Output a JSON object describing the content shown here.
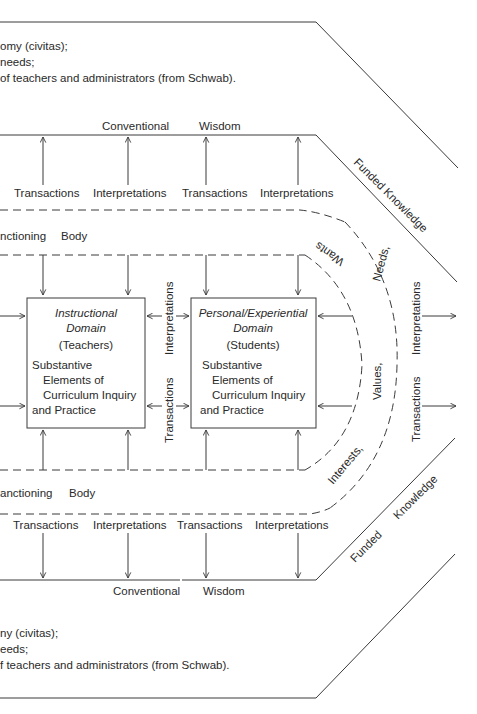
{
  "top_notes": [
    "omy (civitas);",
    "needs;",
    "of teachers and administrators (from Schwab)."
  ],
  "bottom_notes": [
    "ny (civitas);",
    "eeds;",
    "f teachers and administrators (from Schwab)."
  ],
  "top_band": {
    "conventional": "Conventional",
    "wisdom": "Wisdom",
    "labels": [
      "Transactions",
      "Interpretations",
      "Transactions",
      "Interpretations"
    ],
    "funded_knowledge": "Funded Knowledge"
  },
  "bottom_band": {
    "conventional": "Conventional",
    "wisdom": "Wisdom",
    "labels": [
      "Transactions",
      "Interpretations",
      "Transactions",
      "Interpretations"
    ],
    "funded": "Funded",
    "knowledge": "Knowledge"
  },
  "sanctioning_top": {
    "word1": "nctioning",
    "word2": "Body"
  },
  "sanctioning_bottom": {
    "word1": "anctioning",
    "word2": "Body"
  },
  "instructional_box": {
    "title1": "Instructional",
    "title2": "Domain",
    "subtitle": "(Teachers)",
    "body": [
      "Substantive",
      "Elements of",
      "Curriculum Inquiry",
      "and Practice"
    ]
  },
  "personal_box": {
    "title1": "Personal/Experiential",
    "title2": "Domain",
    "subtitle": "(Students)",
    "body": [
      "Substantive",
      "Elements of",
      "Curriculum Inquiry",
      "and Practice"
    ]
  },
  "between_boxes": {
    "upper": "Interpretations",
    "lower": "Transactions"
  },
  "arc_labels": {
    "wants": "Wants",
    "needs": "Needs,",
    "values": "Values,",
    "interests": "Interests,"
  },
  "right_side": {
    "upper": "Interpretations",
    "lower": "Transactions"
  }
}
